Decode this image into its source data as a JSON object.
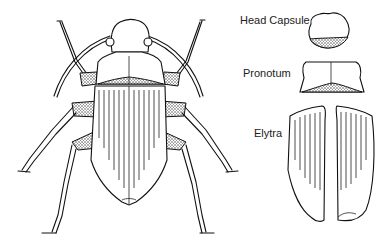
{
  "diagram": {
    "labels": [
      {
        "id": "head",
        "text": "Head Capsule"
      },
      {
        "id": "pronotum",
        "text": "Pronotum"
      },
      {
        "id": "elytra",
        "text": "Elytra"
      }
    ]
  }
}
